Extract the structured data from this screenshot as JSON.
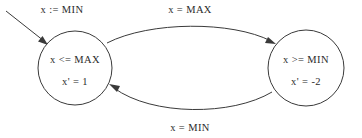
{
  "diagram": {
    "type": "hybrid-automaton-state-diagram",
    "background_color": "#ffffff",
    "line_color": "#3a3a3a",
    "text_color": "#2b2b2b",
    "states": [
      {
        "id": "left",
        "invariant": "x <= MAX",
        "flow": "x' = 1",
        "cx": 75,
        "cy": 68,
        "r": 37
      },
      {
        "id": "right",
        "invariant": "x >= MIN",
        "flow": "x' = -2",
        "cx": 306,
        "cy": 68,
        "r": 38
      }
    ],
    "initial_edge": {
      "label": "x := MIN",
      "label_x": 62,
      "label_y": 12
    },
    "transitions": [
      {
        "id": "top",
        "from": "left",
        "to": "right",
        "label": "x = MAX",
        "label_x": 190,
        "label_y": 12
      },
      {
        "id": "bottom",
        "from": "right",
        "to": "left",
        "label": "x = MIN",
        "label_x": 190,
        "label_y": 130
      }
    ]
  }
}
